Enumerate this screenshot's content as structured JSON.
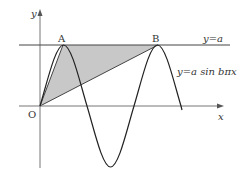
{
  "diagram": {
    "type": "function-graph",
    "labels": {
      "y_axis": "y",
      "x_axis": "x",
      "origin": "O",
      "point_a": "A",
      "point_b": "B",
      "line_label": "y=a",
      "curve_label": "y=a sin bπx"
    },
    "curve": {
      "function": "y = a sin(bπx)",
      "color": "#222222"
    },
    "shaded_region": {
      "description": "Triangle OAB",
      "vertices": [
        "O",
        "A",
        "B"
      ],
      "fill": "#c8c8c8"
    },
    "horizontal_line": {
      "equation": "y = a",
      "color": "#333333"
    }
  }
}
